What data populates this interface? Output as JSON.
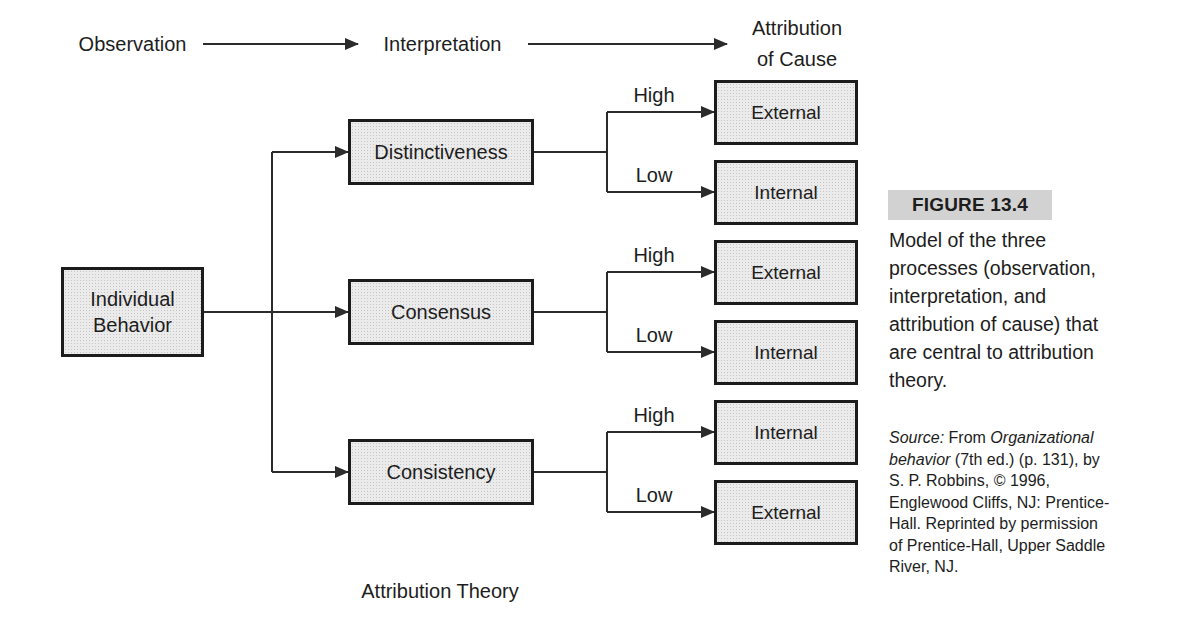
{
  "header": {
    "stage1": "Observation",
    "stage2": "Interpretation",
    "stage3_line1": "Attribution",
    "stage3_line2": "of Cause"
  },
  "diagram": {
    "input_box_line1": "Individual",
    "input_box_line2": "Behavior",
    "rows": [
      {
        "factor": "Distinctiveness",
        "high_label": "High",
        "high_outcome": "External",
        "low_label": "Low",
        "low_outcome": "Internal"
      },
      {
        "factor": "Consensus",
        "high_label": "High",
        "high_outcome": "External",
        "low_label": "Low",
        "low_outcome": "Internal"
      },
      {
        "factor": "Consistency",
        "high_label": "High",
        "high_outcome": "Internal",
        "low_label": "Low",
        "low_outcome": "External"
      }
    ],
    "caption": "Attribution Theory"
  },
  "sidebar": {
    "figure_label": "FIGURE 13.4",
    "caption": "Model of the three processes (observation, interpretation, and attribution of cause) that are central to attribution theory.",
    "source_segments": [
      {
        "text": "Source:",
        "italic": true
      },
      {
        "text": " From ",
        "italic": false
      },
      {
        "text": "Organizational behavior",
        "italic": true
      },
      {
        "text": " (7th ed.) (p. 131), by S. P. Robbins, © 1996, Englewood Cliffs, NJ: Prentice-Hall. Reprinted by permission of Prentice-Hall, Upper Saddle River, NJ.",
        "italic": false
      }
    ]
  },
  "colors": {
    "background": "#ffffff",
    "box-fill": "#ebebeb",
    "box-border": "#1c1c1c",
    "line": "#2b2b2b",
    "text": "#1d1d1d",
    "figure-highlight": "#d2d2d2"
  }
}
